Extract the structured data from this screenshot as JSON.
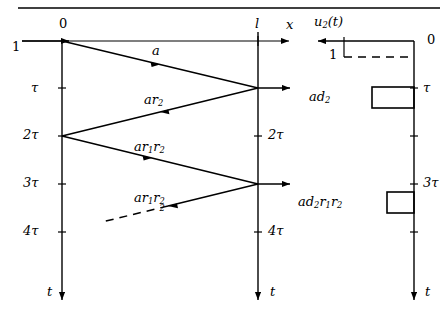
{
  "figure": {
    "background_color": "#ffffff",
    "stroke_color": "#000000",
    "width": 448,
    "height": 323
  },
  "top_rule": {
    "present": true,
    "y": 8,
    "x_start": 18,
    "x_end": 440
  },
  "lattice": {
    "axis_x_label": "x",
    "origin_label": "0",
    "length_label": "l",
    "time_label_left": "t",
    "time_label_right": "t",
    "input_label": "1",
    "left_axis_ticks": [
      {
        "label": "τ"
      },
      {
        "label": "2τ"
      },
      {
        "label": "3τ"
      },
      {
        "label": "4τ"
      }
    ],
    "right_axis_ticks": [
      {
        "label": "2τ"
      },
      {
        "label": "4τ"
      }
    ],
    "wave_labels": [
      {
        "text_parts": {
          "base": "a",
          "sub": "",
          "sup": ""
        },
        "plain": "a"
      },
      {
        "plain": "ar2"
      },
      {
        "plain": "ar1r2"
      },
      {
        "plain": "ar1r2^2"
      }
    ],
    "label_a": "a",
    "label_ar2_base": "ar",
    "label_ar2_sub": "2",
    "label_ar1r2_base": "ar",
    "label_ar1r2_sub1": "1",
    "label_ar1r2_r": "r",
    "label_ar1r2_sub2": "2",
    "label_ar1r2sq_base": "ar",
    "label_ar1r2sq_sub1": "1",
    "label_ar1r2sq_r": "r",
    "label_ar1r2sq_sub2": "2",
    "label_ar1r2sq_sup": "2"
  },
  "output_plot": {
    "signal_label_base": "u",
    "signal_label_sub": "2",
    "signal_label_arg": "(t)",
    "signal_label_plain": "u2(t)",
    "zero_label": "0",
    "unit_label": "1",
    "time_label": "t",
    "axis_ticks": [
      {
        "label": "τ"
      },
      {
        "label": "3τ"
      }
    ],
    "pulses": [
      {
        "label_base": "ad",
        "label_sub": "2",
        "label_plain": "ad2",
        "start_time": "τ",
        "amplitude_fraction": 1.0
      },
      {
        "label_base": "ad",
        "label_sub1": "2",
        "label_r1": "r",
        "label_sub2": "1",
        "label_r2": "r",
        "label_sub3": "2",
        "label_plain": "ad2r1r2",
        "start_time": "3τ",
        "amplitude_fraction": 0.62
      }
    ],
    "dashed_reference_label": "1"
  }
}
